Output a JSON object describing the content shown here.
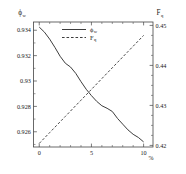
{
  "chart_data": {
    "type": "line",
    "title": "",
    "xlabel": "%",
    "xlim": [
      -0.55,
      10.9
    ],
    "xticks": [
      0,
      5,
      10
    ],
    "xticklabels": [
      "0",
      "5",
      "10"
    ],
    "grid": false,
    "legend_position": "top-center",
    "axes": [
      {
        "id": "left",
        "label": "ϕ",
        "label_sub": "w",
        "ylim": [
          0.9248,
          0.93465
        ],
        "yticks": [
          0.926,
          0.928,
          0.93,
          0.932,
          0.934
        ],
        "yticklabels": [
          "0.926",
          "0.928",
          "0.93",
          "0.932",
          "0.934"
        ]
      },
      {
        "id": "right",
        "label": "F",
        "label_sub": "q",
        "ylim": [
          0.4196,
          0.45085
        ],
        "yticks": [
          0.42,
          0.43,
          0.44,
          0.45
        ],
        "yticklabels": [
          "0.42",
          "0.43",
          "0.44",
          "0.45"
        ]
      }
    ],
    "series": [
      {
        "name": "ϕw",
        "legend_label": "ϕ",
        "legend_sub": "w",
        "axis": "left",
        "style": "solid",
        "color": "#333333",
        "x": [
          0.0,
          0.5,
          1.0,
          1.5,
          2.0,
          2.5,
          3.0,
          3.5,
          4.0,
          4.5,
          5.0,
          5.5,
          6.0,
          6.5,
          7.0,
          7.5,
          8.0,
          8.5,
          9.0,
          9.5,
          10.0
        ],
        "y": [
          0.93425,
          0.93385,
          0.9333,
          0.93265,
          0.93195,
          0.9314,
          0.9311,
          0.9306,
          0.92995,
          0.92935,
          0.92885,
          0.9284,
          0.92805,
          0.92785,
          0.9276,
          0.92705,
          0.9266,
          0.92615,
          0.9258,
          0.92555,
          0.9252
        ]
      },
      {
        "name": "Fq",
        "legend_label": "F",
        "legend_sub": "q",
        "axis": "right",
        "style": "dashed",
        "color": "#333333",
        "x": [
          0.0,
          0.5,
          1.0,
          1.5,
          2.0,
          2.5,
          3.0,
          3.5,
          4.0,
          4.5,
          5.0,
          5.5,
          6.0,
          6.5,
          7.0,
          7.5,
          8.0,
          8.5,
          9.0,
          9.5,
          10.0
        ],
        "y": [
          0.4205,
          0.42185,
          0.4232,
          0.42455,
          0.4259,
          0.42725,
          0.4286,
          0.42995,
          0.4313,
          0.43265,
          0.434,
          0.43535,
          0.4367,
          0.43805,
          0.4394,
          0.44075,
          0.4421,
          0.44345,
          0.4448,
          0.44615,
          0.4475
        ]
      }
    ]
  }
}
